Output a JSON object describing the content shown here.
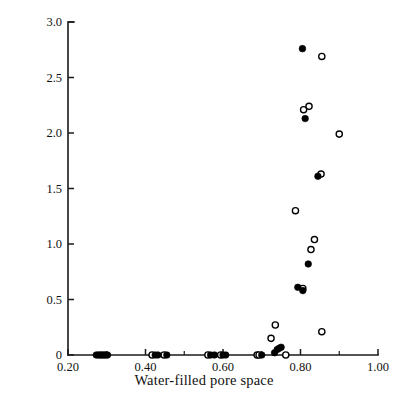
{
  "chart_data": {
    "type": "scatter",
    "title": "",
    "xlabel": "Water-filled pore space",
    "ylabel": "Denitrification, μg N g⁻¹ day⁻¹",
    "ylabel_parts": {
      "lead": "Denitrification, μg N g",
      "sup1": "−1",
      "mid": " day",
      "sup2": "−1"
    },
    "xlim": [
      0.2,
      1.0
    ],
    "ylim": [
      0.0,
      3.0
    ],
    "grid": false,
    "legend": "none",
    "x_ticks": [
      0.2,
      0.4,
      0.6,
      0.8,
      1.0
    ],
    "x_tick_labels": [
      "0.20",
      "0.40",
      "0.60",
      "0.80",
      "1.00"
    ],
    "x_minor_ticks": [
      0.3,
      0.5,
      0.7,
      0.9
    ],
    "y_ticks": [
      0.0,
      0.5,
      1.0,
      1.5,
      2.0,
      2.5,
      3.0
    ],
    "y_tick_labels": [
      "0",
      "0.5",
      "1.0",
      "1.5",
      "2.0",
      "2.5",
      "3.0"
    ],
    "series": [
      {
        "name": "filled",
        "marker": "filled-circle",
        "color": "#000000",
        "points": [
          [
            0.273,
            0.0
          ],
          [
            0.278,
            0.0
          ],
          [
            0.282,
            0.0
          ],
          [
            0.286,
            0.0
          ],
          [
            0.29,
            0.0
          ],
          [
            0.294,
            0.0
          ],
          [
            0.298,
            0.0
          ],
          [
            0.302,
            0.0
          ],
          [
            0.425,
            0.0
          ],
          [
            0.432,
            0.0
          ],
          [
            0.455,
            0.0
          ],
          [
            0.568,
            0.0
          ],
          [
            0.578,
            0.0
          ],
          [
            0.6,
            0.0
          ],
          [
            0.607,
            0.0
          ],
          [
            0.7,
            0.0
          ],
          [
            0.733,
            0.02
          ],
          [
            0.74,
            0.05
          ],
          [
            0.745,
            0.06
          ],
          [
            0.75,
            0.07
          ],
          [
            0.793,
            0.61
          ],
          [
            0.806,
            0.58
          ],
          [
            0.82,
            0.82
          ],
          [
            0.845,
            1.61
          ],
          [
            0.812,
            2.13
          ],
          [
            0.805,
            2.76
          ]
        ]
      },
      {
        "name": "open",
        "marker": "open-circle",
        "color": "#000000",
        "points": [
          [
            0.417,
            0.0
          ],
          [
            0.448,
            0.0
          ],
          [
            0.561,
            0.0
          ],
          [
            0.594,
            0.0
          ],
          [
            0.688,
            0.0
          ],
          [
            0.693,
            0.0
          ],
          [
            0.762,
            0.0
          ],
          [
            0.724,
            0.15
          ],
          [
            0.735,
            0.27
          ],
          [
            0.855,
            0.21
          ],
          [
            0.806,
            0.6
          ],
          [
            0.827,
            0.95
          ],
          [
            0.836,
            1.04
          ],
          [
            0.787,
            1.3
          ],
          [
            0.853,
            1.63
          ],
          [
            0.9,
            1.99
          ],
          [
            0.808,
            2.21
          ],
          [
            0.822,
            2.24
          ],
          [
            0.855,
            2.69
          ]
        ]
      }
    ]
  },
  "axes_geometry": {
    "plot_left_px": 68,
    "plot_right_px": 378,
    "plot_top_px": 22,
    "plot_bottom_px": 355
  }
}
